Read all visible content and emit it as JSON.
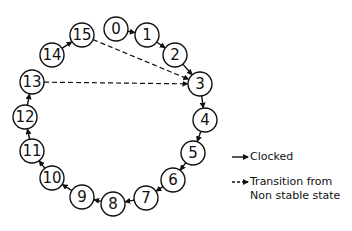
{
  "diagram": {
    "type": "state-transition-ring",
    "states": [
      {
        "id": "0",
        "label": "0",
        "x": 116,
        "y": 29
      },
      {
        "id": "1",
        "label": "1",
        "x": 147,
        "y": 35
      },
      {
        "id": "2",
        "label": "2",
        "x": 175,
        "y": 55
      },
      {
        "id": "3",
        "label": "3",
        "x": 200,
        "y": 84
      },
      {
        "id": "4",
        "label": "4",
        "x": 205,
        "y": 120
      },
      {
        "id": "5",
        "label": "5",
        "x": 193,
        "y": 153
      },
      {
        "id": "6",
        "label": "6",
        "x": 173,
        "y": 180
      },
      {
        "id": "7",
        "label": "7",
        "x": 146,
        "y": 198
      },
      {
        "id": "8",
        "label": "8",
        "x": 113,
        "y": 204
      },
      {
        "id": "9",
        "label": "9",
        "x": 82,
        "y": 197
      },
      {
        "id": "10",
        "label": "10",
        "x": 52,
        "y": 178
      },
      {
        "id": "11",
        "label": "11",
        "x": 32,
        "y": 151
      },
      {
        "id": "12",
        "label": "12",
        "x": 25,
        "y": 117
      },
      {
        "id": "13",
        "label": "13",
        "x": 32,
        "y": 82
      },
      {
        "id": "14",
        "label": "14",
        "x": 52,
        "y": 55
      },
      {
        "id": "15",
        "label": "15",
        "x": 82,
        "y": 35
      }
    ],
    "clocked_transitions": [
      [
        "0",
        "1"
      ],
      [
        "1",
        "2"
      ],
      [
        "2",
        "3"
      ],
      [
        "3",
        "4"
      ],
      [
        "4",
        "5"
      ],
      [
        "5",
        "6"
      ],
      [
        "6",
        "7"
      ],
      [
        "7",
        "8"
      ],
      [
        "8",
        "9"
      ],
      [
        "9",
        "10"
      ],
      [
        "10",
        "11"
      ],
      [
        "11",
        "12"
      ],
      [
        "12",
        "13"
      ],
      [
        "14",
        "15"
      ]
    ],
    "non_stable_transitions": [
      [
        "15",
        "3"
      ],
      [
        "13",
        "3"
      ]
    ],
    "legend": {
      "clocked": "Clocked",
      "non_stable_line1": "Transition from",
      "non_stable_line2": "Non stable state"
    }
  }
}
